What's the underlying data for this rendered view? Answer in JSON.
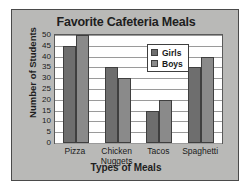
{
  "chart_data": {
    "type": "bar",
    "title": "Favorite Cafeteria Meals",
    "xlabel": "Types of Meals",
    "ylabel": "Number of Students",
    "categories": [
      "Pizza",
      "Chicken Nuggets",
      "Tacos",
      "Spaghetti"
    ],
    "category_lines": [
      [
        "Pizza"
      ],
      [
        "Chicken",
        "Nuggets"
      ],
      [
        "Tacos"
      ],
      [
        "Spaghetti"
      ]
    ],
    "series": [
      {
        "name": "Girls",
        "values": [
          45,
          35,
          15,
          35
        ],
        "color": "#6e6e6e"
      },
      {
        "name": "Boys",
        "values": [
          50,
          30,
          20,
          40
        ],
        "color": "#8a8a8a"
      }
    ],
    "ylim": [
      0,
      50
    ],
    "ytick_step": 5,
    "ytick_labels": [
      "50",
      "45",
      "40",
      "35",
      "30",
      "25",
      "20",
      "15",
      "10",
      "5",
      "0"
    ],
    "grid": true,
    "legend_position": "upper-right-inside"
  },
  "legend": {
    "entries": [
      {
        "label": "Girls"
      },
      {
        "label": "Boys"
      }
    ]
  },
  "colors": {
    "panel_background": "#b9b9b7",
    "plot_background": "#ffffff",
    "panel_border": "#4a4a4a",
    "gridline": "#9a9a9a",
    "text": "#1a1a1a",
    "girls": "#6e6e6e",
    "boys": "#8a8a8a"
  }
}
